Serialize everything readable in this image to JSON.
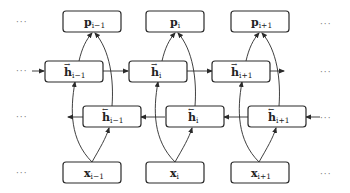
{
  "diagram": {
    "type": "bidirectional-rnn",
    "ellipsis": "···",
    "columns": [
      {
        "output": {
          "base": "p",
          "sub": "i−1"
        },
        "forward": {
          "base": "h",
          "sub": "i−1",
          "arrow": "→"
        },
        "backward": {
          "base": "h",
          "sub": "i−1",
          "arrow": "←"
        },
        "input": {
          "base": "x",
          "sub": "i−1"
        }
      },
      {
        "output": {
          "base": "p",
          "sub": "i"
        },
        "forward": {
          "base": "h",
          "sub": "i",
          "arrow": "→"
        },
        "backward": {
          "base": "h",
          "sub": "i",
          "arrow": "←"
        },
        "input": {
          "base": "x",
          "sub": "i"
        }
      },
      {
        "output": {
          "base": "p",
          "sub": "i+1"
        },
        "forward": {
          "base": "h",
          "sub": "i+1",
          "arrow": "→"
        },
        "backward": {
          "base": "h",
          "sub": "i+1",
          "arrow": "←"
        },
        "input": {
          "base": "x",
          "sub": "i+1"
        }
      }
    ],
    "rows": [
      "output",
      "forward",
      "backward",
      "input"
    ],
    "colors": {
      "stroke": "#2a2a2a",
      "text": "#222222",
      "ellipsis": "#777777",
      "background": "#ffffff"
    }
  }
}
